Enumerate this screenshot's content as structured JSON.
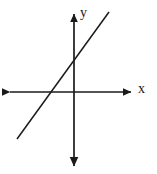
{
  "figure": {
    "background_color": "#ffffff",
    "stroke_color": "#1a1a1a",
    "width": 157,
    "height": 174
  },
  "axes": {
    "x_axis": {
      "label": "x",
      "orientation": "horizontal",
      "arrowheads": "both",
      "pixel_y": 92,
      "pixel_x_start": 8,
      "pixel_x_end": 133
    },
    "y_axis": {
      "label": "y",
      "orientation": "vertical",
      "arrowheads": "both",
      "pixel_x": 74,
      "pixel_y_start": 12,
      "pixel_y_end": 168
    },
    "origin": {
      "pixel_x": 74,
      "pixel_y": 92
    }
  },
  "chart_data": {
    "type": "line",
    "title": "",
    "subtitle": "",
    "xlabel": "x",
    "ylabel": "y",
    "grid": false,
    "legend": false,
    "legend_position": "none",
    "tick_labels_x": [],
    "tick_labels_y": [],
    "xlim": [
      -6,
      6
    ],
    "ylim": [
      -6,
      6
    ],
    "series": [
      {
        "name": "line",
        "description": "straight line with positive slope crossing the x-axis left of the origin and the y-axis above the origin",
        "slope": 1.38,
        "y_intercept": 2.0,
        "x_intercept": -1.45,
        "x": [
          -3.0,
          3.0
        ],
        "y": [
          -2.14,
          6.14
        ],
        "pixel_points": [
          {
            "x": 17,
            "y": 139
          },
          {
            "x": 109,
            "y": 12
          }
        ]
      }
    ],
    "annotations": [
      {
        "text": "x",
        "pixel_x": 143,
        "pixel_y": 89,
        "role": "x-axis-label"
      },
      {
        "text": "y",
        "pixel_x": 84,
        "pixel_y": 14,
        "role": "y-axis-label"
      }
    ]
  }
}
